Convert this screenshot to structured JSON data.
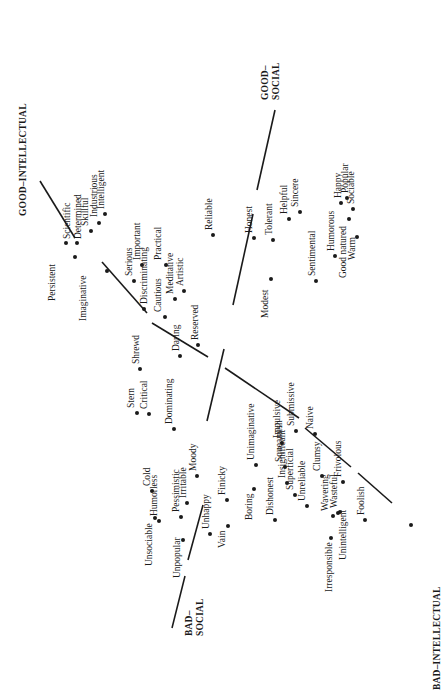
{
  "figure": {
    "orientation": "rotated -90deg (text reads bottom-to-top)",
    "axes": [
      {
        "id": "intellectual",
        "label_good": "GOOD–INTELLECTUAL",
        "label_bad": "BAD–INTELLECTUAL",
        "segments": [
          [
            40,
            181,
            75,
            238
          ],
          [
            102,
            262,
            147,
            313
          ],
          [
            152,
            323,
            208,
            357
          ],
          [
            225,
            368,
            299,
            418
          ],
          [
            305,
            428,
            351,
            467
          ],
          [
            358,
            473,
            392,
            503
          ]
        ],
        "good_label_pos": [
          18,
          216
        ],
        "bad_label_pos": [
          432,
          690
        ]
      },
      {
        "id": "social",
        "label_good": "GOOD–SOCIAL",
        "label_bad": "BAD–SOCIAL",
        "segments": [
          [
            275,
            110,
            257,
            190
          ],
          [
            253,
            214,
            233,
            305
          ],
          [
            224,
            349,
            207,
            421
          ],
          [
            203,
            505,
            188,
            560
          ],
          [
            185,
            576,
            172,
            628
          ]
        ],
        "good_label_pos": [
          260,
          100
        ],
        "bad_label_pos": [
          184,
          636
        ]
      }
    ],
    "traits": [
      {
        "label": "Scientific",
        "dot": [
          66,
          243
        ],
        "pos": [
          68,
          239
        ]
      },
      {
        "label": "Determined",
        "dot": [
          77,
          243
        ],
        "pos": [
          79,
          239
        ]
      },
      {
        "label": "Persistent",
        "dot": [
          75,
          257
        ],
        "pos": [
          53,
          301
        ]
      },
      {
        "label": "Skillful",
        "dot": [
          91,
          231
        ],
        "pos": [
          86,
          226
        ]
      },
      {
        "label": "Industrious",
        "dot": [
          99,
          223
        ],
        "pos": [
          95,
          217
        ]
      },
      {
        "label": "Intelligent",
        "dot": [
          105,
          214
        ],
        "pos": [
          102,
          209
        ]
      },
      {
        "label": "Imaginative",
        "dot": [
          107,
          271
        ],
        "pos": [
          84,
          321
        ]
      },
      {
        "label": "Serious",
        "dot": [
          134,
          281
        ],
        "pos": [
          130,
          276
        ]
      },
      {
        "label": "Important",
        "dot": [
          142,
          265
        ],
        "pos": [
          138,
          260
        ]
      },
      {
        "label": "Discriminating",
        "dot": [
          144,
          309
        ],
        "pos": [
          145,
          304
        ]
      },
      {
        "label": "Practical",
        "dot": [
          166,
          265
        ],
        "pos": [
          159,
          260
        ]
      },
      {
        "label": "Cautious",
        "dot": [
          165,
          317
        ],
        "pos": [
          159,
          312
        ]
      },
      {
        "label": "Meditative",
        "dot": [
          175,
          299
        ],
        "pos": [
          171,
          294
        ]
      },
      {
        "label": "Artistic",
        "dot": [
          184,
          291
        ],
        "pos": [
          181,
          286
        ]
      },
      {
        "label": "Reserved",
        "dot": [
          198,
          345
        ],
        "pos": [
          196,
          340
        ]
      },
      {
        "label": "Daring",
        "dot": [
          180,
          356
        ],
        "pos": [
          177,
          351
        ]
      },
      {
        "label": "Shrewd",
        "dot": [
          140,
          369
        ],
        "pos": [
          137,
          364
        ]
      },
      {
        "label": "Stern",
        "dot": [
          137,
          413
        ],
        "pos": [
          132,
          408
        ]
      },
      {
        "label": "Critical",
        "dot": [
          149,
          414
        ],
        "pos": [
          145,
          409
        ]
      },
      {
        "label": "Dominating",
        "dot": [
          174,
          429
        ],
        "pos": [
          170,
          424
        ]
      },
      {
        "label": "Reliable",
        "dot": [
          213,
          235
        ],
        "pos": [
          210,
          230
        ]
      },
      {
        "label": "Honest",
        "dot": [
          254,
          238
        ],
        "pos": [
          250,
          233
        ]
      },
      {
        "label": "Tolerant",
        "dot": [
          273,
          240
        ],
        "pos": [
          270,
          235
        ]
      },
      {
        "label": "Helpful",
        "dot": [
          289,
          219
        ],
        "pos": [
          285,
          214
        ]
      },
      {
        "label": "Sincere",
        "dot": [
          300,
          212
        ],
        "pos": [
          296,
          207
        ]
      },
      {
        "label": "Modest",
        "dot": [
          271,
          279
        ],
        "pos": [
          266,
          318
        ]
      },
      {
        "label": "Sentimental",
        "dot": [
          316,
          281
        ],
        "pos": [
          313,
          276
        ]
      },
      {
        "label": "Humorous",
        "dot": [
          335,
          256
        ],
        "pos": [
          332,
          251
        ]
      },
      {
        "label": "Happy",
        "dot": [
          341,
          203
        ],
        "pos": [
          339,
          198
        ]
      },
      {
        "label": "Popular",
        "dot": [
          347,
          198
        ],
        "pos": [
          346,
          193
        ]
      },
      {
        "label": "Sociable",
        "dot": [
          353,
          209
        ],
        "pos": [
          352,
          204
        ]
      },
      {
        "label": "Good natured",
        "dot": [
          349,
          219
        ],
        "pos": [
          344,
          278
        ]
      },
      {
        "label": "Warm",
        "dot": [
          357,
          237
        ],
        "pos": [
          353,
          260
        ]
      },
      {
        "label": "Cold",
        "dot": [
          152,
          491
        ],
        "pos": [
          148,
          486
        ]
      },
      {
        "label": "Humorless",
        "dot": [
          159,
          521
        ],
        "pos": [
          155,
          516
        ]
      },
      {
        "label": "Unsociable",
        "dot": [
          155,
          518
        ],
        "pos": [
          150,
          566
        ]
      },
      {
        "label": "Pessimistic",
        "dot": [
          181,
          517
        ],
        "pos": [
          177,
          512
        ]
      },
      {
        "label": "Irritable",
        "dot": [
          187,
          503
        ],
        "pos": [
          184,
          498
        ]
      },
      {
        "label": "Moody",
        "dot": [
          197,
          476
        ],
        "pos": [
          194,
          471
        ]
      },
      {
        "label": "Unpopular",
        "dot": [
          183,
          540
        ],
        "pos": [
          178,
          578
        ]
      },
      {
        "label": "Unhappy",
        "dot": [
          210,
          534
        ],
        "pos": [
          207,
          529
        ]
      },
      {
        "label": "Finicky",
        "dot": [
          227,
          500
        ],
        "pos": [
          223,
          495
        ]
      },
      {
        "label": "Vain",
        "dot": [
          228,
          526
        ],
        "pos": [
          223,
          548
        ]
      },
      {
        "label": "Unimaginative",
        "dot": [
          256,
          465
        ],
        "pos": [
          252,
          460
        ]
      },
      {
        "label": "Boring",
        "dot": [
          254,
          489
        ],
        "pos": [
          250,
          520
        ]
      },
      {
        "label": "Impulsive",
        "dot": [
          282,
          443
        ],
        "pos": [
          278,
          438
        ]
      },
      {
        "label": "Submissive",
        "dot": [
          296,
          431
        ],
        "pos": [
          292,
          426
        ]
      },
      {
        "label": "Naive",
        "dot": [
          315,
          434
        ],
        "pos": [
          311,
          429
        ]
      },
      {
        "label": "Squeamish",
        "dot": [
          285,
          467
        ],
        "pos": [
          280,
          462
        ]
      },
      {
        "label": "Insignificant",
        "dot": [
          287,
          483
        ],
        "pos": [
          283,
          478
        ]
      },
      {
        "label": "Superficial",
        "dot": [
          295,
          495
        ],
        "pos": [
          291,
          490
        ]
      },
      {
        "label": "Unreliable",
        "dot": [
          307,
          506
        ],
        "pos": [
          303,
          501
        ]
      },
      {
        "label": "Dishonest",
        "dot": [
          275,
          520
        ],
        "pos": [
          271,
          515
        ]
      },
      {
        "label": "Clumsy",
        "dot": [
          322,
          476
        ],
        "pos": [
          318,
          471
        ]
      },
      {
        "label": "Frivolous",
        "dot": [
          343,
          482
        ],
        "pos": [
          339,
          477
        ]
      },
      {
        "label": "Wavering",
        "dot": [
          333,
          516
        ],
        "pos": [
          326,
          511
        ]
      },
      {
        "label": "Wasteful",
        "dot": [
          338,
          513
        ],
        "pos": [
          335,
          508
        ]
      },
      {
        "label": "Irresponsible",
        "dot": [
          331,
          538
        ],
        "pos": [
          330,
          592
        ]
      },
      {
        "label": "Unintelligent",
        "dot": [
          340,
          512
        ],
        "pos": [
          344,
          560
        ]
      },
      {
        "label": "Foolish",
        "dot": [
          365,
          520
        ],
        "pos": [
          362,
          515
        ]
      },
      {
        "label": "",
        "dot": [
          411,
          525
        ],
        "pos": [
          0,
          0
        ]
      }
    ]
  }
}
